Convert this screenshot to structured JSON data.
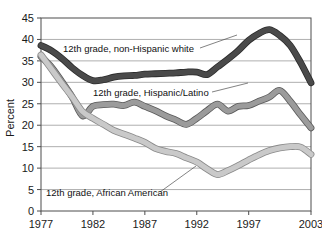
{
  "chart_data": {
    "type": "line",
    "title": "",
    "xlabel": "",
    "ylabel": "Percent",
    "xlim": [
      1977,
      2003
    ],
    "ylim": [
      0,
      45
    ],
    "ytick_step": 5,
    "grid": true,
    "legend_position": "inline-annotations",
    "xticks": [
      "1977",
      "1982",
      "1987",
      "1992",
      "1997",
      "2003"
    ],
    "xtick_values": [
      1977,
      1982,
      1987,
      1992,
      1997,
      2003
    ],
    "yticks": [
      "0",
      "5",
      "10",
      "15",
      "20",
      "25",
      "30",
      "35",
      "40",
      "45"
    ],
    "ytick_values": [
      0,
      5,
      10,
      15,
      20,
      25,
      30,
      35,
      40,
      45
    ],
    "x": [
      1977,
      1978,
      1979,
      1980,
      1981,
      1982,
      1983,
      1984,
      1985,
      1986,
      1987,
      1988,
      1989,
      1990,
      1991,
      1992,
      1993,
      1994,
      1995,
      1996,
      1997,
      1998,
      1999,
      2000,
      2001,
      2002,
      2003
    ],
    "series": [
      {
        "name": "12th grade, non-Hispanic white",
        "color": "#4a4a4a",
        "outline": "#2b2b2b",
        "values": [
          38.6,
          37.4,
          35.6,
          33.4,
          31.6,
          30.4,
          30.6,
          31.2,
          31.5,
          31.6,
          31.9,
          32.0,
          32.1,
          32.2,
          32.4,
          32.4,
          31.8,
          33.6,
          35.4,
          37.4,
          39.8,
          41.4,
          42.3,
          40.9,
          38.6,
          34.6,
          29.9
        ]
      },
      {
        "name": "12th grade, Hispanic/Latino",
        "color": "#9b9b9b",
        "outline": "#5a5a5a",
        "values": [
          36.0,
          33.6,
          30.2,
          26.6,
          22.2,
          24.4,
          24.8,
          24.9,
          24.6,
          25.4,
          24.4,
          23.4,
          22.2,
          21.2,
          20.2,
          21.6,
          23.4,
          24.9,
          23.3,
          24.4,
          24.6,
          25.6,
          26.6,
          28.1,
          25.6,
          22.4,
          19.4
        ]
      },
      {
        "name": "12th grade, African American",
        "color": "#c9c9c9",
        "outline": "#8a8a8a",
        "values": [
          36.4,
          33.1,
          29.8,
          26.6,
          23.2,
          21.6,
          20.2,
          18.8,
          17.9,
          17.0,
          16.0,
          14.6,
          13.9,
          13.4,
          12.4,
          11.4,
          9.8,
          8.5,
          9.4,
          10.6,
          11.9,
          13.1,
          14.1,
          14.7,
          15.0,
          14.9,
          13.2
        ]
      }
    ],
    "annotations": [
      {
        "text": "12th grade, non-Hispanic white",
        "anchor_series": "12th grade, non-Hispanic white"
      },
      {
        "text": "12th grade, Hispanic/Latino",
        "anchor_series": "12th grade, Hispanic/Latino"
      },
      {
        "text": "12th grade, African American",
        "anchor_series": "12th grade, African American"
      }
    ]
  }
}
